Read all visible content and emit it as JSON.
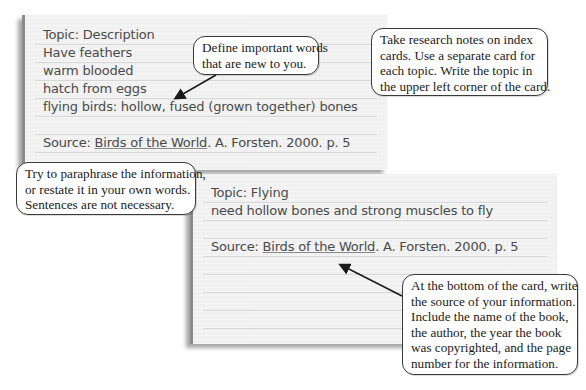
{
  "card1": {
    "lines": [
      "Topic: Description",
      "Have feathers",
      "warm blooded",
      "hatch from eggs",
      "flying birds: hollow, fused (grown together) bones"
    ],
    "source_label": "Source: ",
    "source_title": "Birds of the World",
    "source_rest": ". A. Forsten. 2000. p. 5"
  },
  "card2": {
    "lines": [
      "Topic: Flying",
      "need hollow bones and strong muscles to fly"
    ],
    "source_label": "Source: ",
    "source_title": "Birds of the World",
    "source_rest": ". A. Forsten. 2000. p. 5"
  },
  "callouts": {
    "define": [
      "Define important words",
      "that are new to you."
    ],
    "index_cards": [
      "Take research notes on index",
      "cards. Use a separate card for",
      "each topic. Write the topic in",
      "the upper left corner of the card."
    ],
    "paraphrase": [
      "Try to paraphrase the information,",
      "or restate it in your own words.",
      "Sentences are not necessary."
    ],
    "source": [
      "At the bottom of the card, write",
      "the source of your information.",
      "Include the name of the book,",
      "the author, the year the book",
      "was copyrighted, and the page",
      "number for the information."
    ]
  }
}
